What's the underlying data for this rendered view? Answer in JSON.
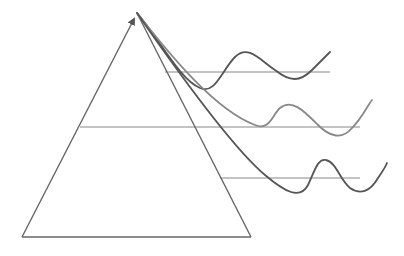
{
  "diagram": {
    "width": 404,
    "height": 256,
    "background": "#ffffff",
    "triangle": {
      "apex": [
        137,
        13
      ],
      "base_left": [
        22,
        237
      ],
      "base_right": [
        251,
        237
      ],
      "stroke": "#666666",
      "stroke_width": 1.4,
      "arrowhead_on": "left-edge-at-apex"
    },
    "levels": [
      {
        "name": "top",
        "y": 72,
        "x_start": 165,
        "x_end": 330,
        "stroke": "#888888"
      },
      {
        "name": "middle",
        "y": 127,
        "x_start": 80,
        "x_end": 360,
        "stroke": "#888888"
      },
      {
        "name": "bottom",
        "y": 178,
        "x_start": 220,
        "x_end": 360,
        "stroke": "#888888"
      }
    ],
    "curves": [
      {
        "name": "top-wave",
        "stroke": "#555555",
        "stroke_width": 1.8,
        "path": "M137,13 C160,40 180,80 200,88 C215,95 222,70 235,57 C248,44 260,60 275,70 C290,82 300,82 312,70 C318,64 324,58 330,52"
      },
      {
        "name": "middle-wave",
        "stroke": "#888888",
        "stroke_width": 1.8,
        "path": "M137,13 C170,55 215,110 255,125 C270,131 272,115 280,108 C292,98 305,112 318,125 C330,137 342,140 352,128 C362,118 366,108 372,100"
      },
      {
        "name": "bottom-wave",
        "stroke": "#555555",
        "stroke_width": 1.8,
        "path": "M137,13 C180,75 235,150 265,175 C285,192 300,200 308,185 C315,170 318,158 326,160 C336,162 340,180 350,188 C360,195 370,192 378,178 C382,172 385,168 387,163"
      }
    ],
    "extra_edges": [
      {
        "name": "inner-diagonal-1",
        "from": [
          137,
          13
        ],
        "to": [
          251,
          237
        ],
        "stroke": "#666666"
      }
    ]
  }
}
